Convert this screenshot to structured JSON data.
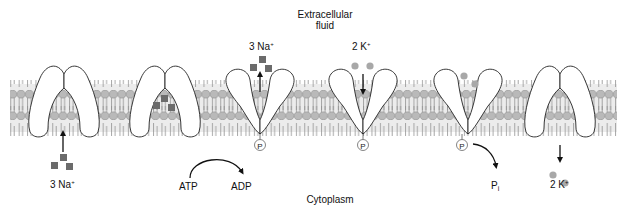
{
  "regions": {
    "extracellular_line1": "Extracellular",
    "extracellular_line2": "fluid",
    "cytoplasm": "Cytoplasm"
  },
  "ions": {
    "sodium": {
      "count": "3",
      "symbol": "Na",
      "charge": "+",
      "shape": "square",
      "color": "#6b6b6b"
    },
    "potassium": {
      "count": "2",
      "symbol": "K",
      "charge": "+",
      "shape": "circle",
      "color": "#a8a8a8"
    }
  },
  "labels": {
    "na_in": {
      "count": "3 Na",
      "charge": "+"
    },
    "na_out": {
      "count": "3 Na",
      "charge": "+"
    },
    "k_out": {
      "count": "2 K",
      "charge": "+"
    },
    "k_in": {
      "count": "2 K",
      "charge": "+"
    },
    "atp": "ATP",
    "adp": "ADP",
    "pi_base": "P",
    "pi_sub": "i",
    "phosphate": "P"
  },
  "colors": {
    "membrane_fill": "#e4e4e4",
    "lipid_head": "#b9b9b9",
    "lipid_head_stroke": "#8a8a8a",
    "lipid_tail": "#8f8f8f",
    "pump_fill": "#ffffff",
    "pump_stroke": "#222222",
    "arrow": "#111111"
  },
  "pump_states": [
    {
      "step": 1,
      "orientation": "open-to-cytoplasm",
      "cargo": "none"
    },
    {
      "step": 2,
      "orientation": "open-to-cytoplasm",
      "cargo": "3 Na+ bound"
    },
    {
      "step": 3,
      "orientation": "open-to-extracellular",
      "cargo": "3 Na+ released",
      "phosphorylated": true
    },
    {
      "step": 4,
      "orientation": "open-to-extracellular",
      "cargo": "2 K+ binding",
      "phosphorylated": true
    },
    {
      "step": 5,
      "orientation": "open-to-extracellular",
      "cargo": "2 K+ bound",
      "phosphorylated": true
    },
    {
      "step": 6,
      "orientation": "open-to-cytoplasm",
      "cargo": "2 K+ released"
    }
  ]
}
